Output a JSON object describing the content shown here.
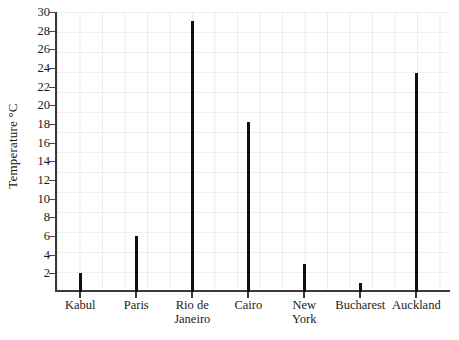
{
  "chart_data": {
    "type": "bar",
    "title": "",
    "xlabel": "",
    "ylabel": "Temperature °C",
    "categories": [
      "Kabul",
      "Paris",
      "Rio de Janeiro",
      "Cairo",
      "New York",
      "Bucharest",
      "Auckland"
    ],
    "values": [
      2,
      6,
      29,
      18.2,
      3,
      1,
      23.5
    ],
    "ylim": [
      0,
      30
    ],
    "y_ticks": [
      2,
      4,
      6,
      8,
      10,
      12,
      14,
      16,
      18,
      20,
      22,
      24,
      26,
      28,
      30
    ],
    "y_tick_labels": [
      "2",
      "4",
      "6",
      "8",
      "10",
      "12",
      "14",
      "16",
      "18",
      "20",
      "22",
      "24",
      "26",
      "28",
      "30"
    ],
    "grid": true,
    "legend": "none",
    "bar_color": "#111111",
    "grid_color": "#ececec",
    "axis_color": "#3a3a3a",
    "category_label_lines": [
      [
        "Kabul"
      ],
      [
        "Paris"
      ],
      [
        "Rio de",
        "Janeiro"
      ],
      [
        "Cairo"
      ],
      [
        "New",
        "York"
      ],
      [
        "Bucharest"
      ],
      [
        "Auckland"
      ]
    ]
  }
}
